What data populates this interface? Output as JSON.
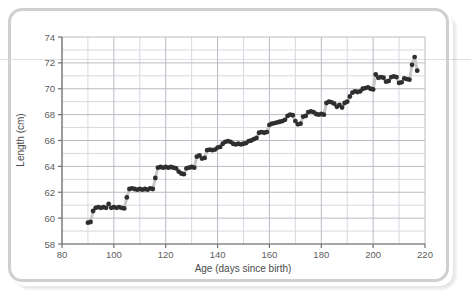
{
  "figure": {
    "frame_color": "#cfcfcf",
    "background": "#ffffff"
  },
  "chart_data": {
    "type": "line",
    "title": "",
    "subtitle": "",
    "xlabel": "Age (days since birth)",
    "ylabel": "Length (cm)",
    "xlim": [
      80,
      220
    ],
    "ylim": [
      58,
      74
    ],
    "x_ticks": [
      80,
      100,
      120,
      140,
      160,
      180,
      200,
      220
    ],
    "x_tick_labels": [
      "80",
      "100",
      "120",
      "140",
      "160",
      "180",
      "200",
      "220"
    ],
    "x_minor_step": 10,
    "y_ticks": [
      58,
      60,
      62,
      64,
      66,
      68,
      70,
      72,
      74
    ],
    "y_tick_labels": [
      "58",
      "60",
      "62",
      "64",
      "66",
      "68",
      "70",
      "72",
      "74"
    ],
    "y_minor_step": 1,
    "grid": true,
    "legend": "none",
    "line_color": "#c8c8c8",
    "marker_color": "#2e2e2e",
    "marker_shape": "circle",
    "marker_size": 2.4,
    "line_style": "saltatory-step",
    "series": [
      {
        "name": "Length",
        "x": [
          90,
          91,
          92,
          93,
          94,
          95,
          96,
          97,
          98,
          99,
          100,
          101,
          102,
          103,
          104,
          105,
          106,
          107,
          108,
          109,
          110,
          111,
          112,
          113,
          114,
          115,
          116,
          117,
          118,
          119,
          120,
          121,
          122,
          123,
          124,
          125,
          126,
          127,
          128,
          129,
          130,
          131,
          132,
          133,
          134,
          135,
          136,
          137,
          138,
          139,
          140,
          141,
          142,
          143,
          144,
          145,
          146,
          147,
          148,
          149,
          150,
          151,
          152,
          153,
          154,
          155,
          156,
          157,
          158,
          159,
          160,
          161,
          162,
          163,
          164,
          165,
          166,
          167,
          168,
          169,
          170,
          171,
          172,
          173,
          174,
          175,
          176,
          177,
          178,
          179,
          180,
          181,
          182,
          183,
          184,
          185,
          186,
          187,
          188,
          189,
          190,
          191,
          192,
          193,
          194,
          195,
          196,
          197,
          198,
          199,
          200,
          201,
          202,
          203,
          204,
          205,
          206,
          207,
          208,
          209,
          210,
          211,
          212,
          213,
          214,
          215,
          216,
          217
        ],
        "y": [
          59.65,
          59.7,
          60.55,
          60.8,
          60.85,
          60.8,
          60.85,
          60.8,
          61.1,
          60.8,
          60.85,
          60.8,
          60.85,
          60.8,
          60.75,
          61.6,
          62.25,
          62.3,
          62.25,
          62.2,
          62.25,
          62.2,
          62.25,
          62.2,
          62.3,
          62.25,
          63.1,
          63.9,
          63.95,
          63.9,
          63.95,
          63.9,
          63.95,
          63.9,
          63.85,
          63.6,
          63.45,
          63.4,
          63.85,
          63.9,
          63.95,
          63.9,
          64.75,
          64.85,
          64.6,
          64.65,
          65.25,
          65.3,
          65.25,
          65.3,
          65.45,
          65.5,
          65.75,
          65.9,
          65.95,
          65.9,
          65.75,
          65.7,
          65.75,
          65.7,
          65.75,
          65.8,
          65.95,
          66.0,
          66.1,
          66.2,
          66.6,
          66.65,
          66.6,
          66.65,
          67.2,
          67.3,
          67.35,
          67.4,
          67.45,
          67.5,
          67.6,
          67.9,
          68.0,
          67.95,
          67.5,
          67.25,
          67.3,
          67.85,
          67.9,
          68.2,
          68.25,
          68.2,
          68.05,
          68.0,
          68.05,
          68.0,
          68.9,
          69.0,
          68.95,
          68.85,
          68.6,
          68.75,
          68.55,
          68.9,
          69.0,
          69.4,
          69.7,
          69.8,
          69.75,
          69.8,
          70.0,
          70.05,
          70.1,
          70.0,
          69.95,
          71.1,
          70.85,
          70.9,
          70.85,
          70.55,
          70.6,
          70.9,
          70.95,
          70.9,
          70.45,
          70.5,
          70.8,
          70.75,
          70.7,
          71.85,
          72.45,
          71.4
        ],
        "description": "Infant recumbent length measured daily, showing saltatory (stepwise) growth with plateaus and sudden jumps."
      }
    ]
  }
}
